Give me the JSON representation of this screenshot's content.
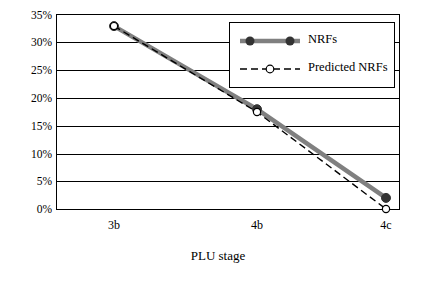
{
  "chart_data": {
    "type": "line",
    "title": "",
    "xlabel": "PLU stage",
    "ylabel": "",
    "categories": [
      "3b",
      "4b",
      "4c"
    ],
    "ylim": [
      0,
      0.35
    ],
    "ytick_labels": [
      "0%",
      "5%",
      "10%",
      "15%",
      "20%",
      "25%",
      "30%",
      "35%"
    ],
    "ytick_values": [
      0,
      5,
      10,
      15,
      20,
      25,
      30,
      35
    ],
    "grid": true,
    "legend_position": "top-right",
    "series": [
      {
        "name": "NRFs",
        "values": [
          33,
          18,
          2
        ],
        "style": "solid-thick-gray",
        "marker": "filled-circle",
        "color": "#808080"
      },
      {
        "name": "Predicted NRFs",
        "values": [
          33,
          17.5,
          0
        ],
        "style": "dashed-black",
        "marker": "open-circle",
        "color": "#000000"
      }
    ]
  },
  "legend": {
    "items": [
      {
        "label": "NRFs"
      },
      {
        "label": "Predicted NRFs"
      }
    ]
  },
  "axes": {
    "x_title": "PLU stage",
    "x_ticks": [
      "3b",
      "4b",
      "4c"
    ],
    "y_ticks": [
      "35%",
      "30%",
      "25%",
      "20%",
      "15%",
      "10%",
      "5%",
      "0%"
    ]
  }
}
